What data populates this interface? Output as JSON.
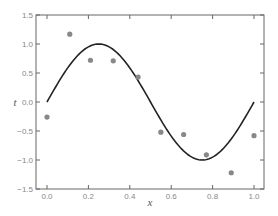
{
  "chart_data": {
    "type": "scatter",
    "title": "",
    "xlabel": "x",
    "ylabel": "t",
    "xlim": [
      -0.05,
      1.05
    ],
    "ylim": [
      -1.5,
      1.5
    ],
    "xticks": [
      "0.0",
      "0.2",
      "0.4",
      "0.6",
      "0.8",
      "1.0"
    ],
    "yticks": [
      "1.5",
      "1.0",
      "0.5",
      "0.0",
      "-0.5",
      "-1.0",
      "-1.5"
    ],
    "grid": false,
    "legend": null,
    "series": [
      {
        "name": "data points",
        "type": "scatter",
        "color": "#888888",
        "x": [
          0.0,
          0.11,
          0.21,
          0.32,
          0.44,
          0.55,
          0.66,
          0.77,
          0.89,
          1.0
        ],
        "y": [
          -0.26,
          1.17,
          0.72,
          0.71,
          0.43,
          -0.52,
          -0.56,
          -0.91,
          -1.22,
          -0.58
        ]
      },
      {
        "name": "sin(2πx)",
        "type": "line",
        "color": "#222222",
        "function": "sin(2*pi*x)",
        "x_range": [
          0.0,
          1.0
        ]
      }
    ]
  }
}
